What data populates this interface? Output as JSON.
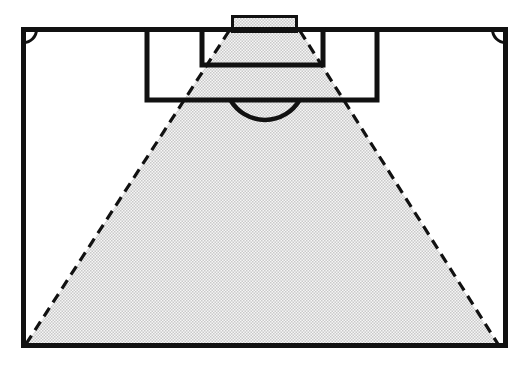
{
  "figure": {
    "background": "#ffffff"
  },
  "colors": {
    "line": "#111111",
    "stipple_dot": "#c9c9c9",
    "stipple_base": "#f6f6f6"
  },
  "pitch": {
    "boundary": {
      "x": 23.5,
      "y": 29.5,
      "width": 482,
      "height": 316
    },
    "penalty_area": {
      "x": 147,
      "y": 29.5,
      "width": 230,
      "height": 70.5
    },
    "goal_area": {
      "x": 202,
      "y": 29.5,
      "width": 121,
      "height": 35.5
    },
    "goal": {
      "x": 232.5,
      "y": 16.5,
      "width": 64,
      "height": 15
    },
    "penalty_arc_path": "M 231 101 A 40 40 0 0 0 299 101",
    "corner_arc_top_left_path": "M 23.5 42.5 A 13 13 0 0 0 36.5 29.5",
    "corner_arc_top_right_path": "M 492.5 29.5 A 13 13 0 0 0 505.5 42.5"
  },
  "cone": {
    "polygon_points": "229,30 300,30 498,345 26,345",
    "left_edge": {
      "x1": 229,
      "y1": 31,
      "x2": 26,
      "y2": 344
    },
    "right_edge": {
      "x1": 300,
      "y1": 31,
      "x2": 498,
      "y2": 344
    },
    "dash_pattern": "10 6.5"
  }
}
